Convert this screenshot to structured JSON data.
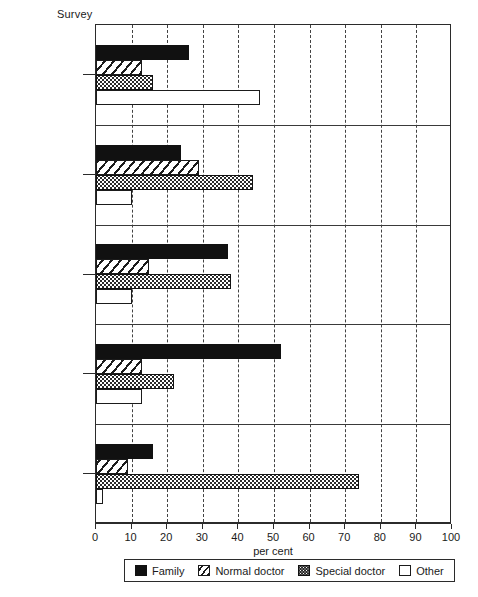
{
  "chart_data": {
    "type": "bar",
    "orientation": "horizontal",
    "title": "",
    "ylabel": "Survey",
    "xlabel": "per cent",
    "xlim": [
      0,
      100
    ],
    "xticks": [
      0,
      10,
      20,
      30,
      40,
      50,
      60,
      70,
      80,
      90,
      100
    ],
    "grid": true,
    "grid_axis": "x",
    "grid_style": "dashed",
    "legend_position": "below-axis",
    "categories": [
      "CAR",
      "Guinea Bissau",
      "Togo",
      "Burundi",
      "Mauritius"
    ],
    "series": [
      {
        "name": "Family",
        "pattern": "solid-black",
        "values": [
          26,
          24,
          37,
          52,
          16
        ]
      },
      {
        "name": "Normal doctor",
        "pattern": "diagonal-hatch",
        "values": [
          13,
          29,
          15,
          13,
          9
        ]
      },
      {
        "name": "Special doctor",
        "pattern": "dotted-dark",
        "values": [
          16,
          44,
          38,
          22,
          74
        ]
      },
      {
        "name": "Other",
        "pattern": "white-open",
        "values": [
          46,
          10,
          10,
          13,
          2
        ]
      }
    ]
  },
  "axis": {
    "y_title": "Survey",
    "x_title": "per cent",
    "tick_labels": [
      "0",
      "10",
      "20",
      "30",
      "40",
      "50",
      "60",
      "70",
      "80",
      "90",
      "100"
    ]
  },
  "categories": [
    {
      "label": "CAR"
    },
    {
      "label": "Guinea Bissau"
    },
    {
      "label": "Togo"
    },
    {
      "label": "Burundi"
    },
    {
      "label": "Mauritius"
    }
  ],
  "legend": {
    "items": [
      {
        "label": "Family",
        "swatch": "solid-black-swatch"
      },
      {
        "label": "Normal doctor",
        "swatch": "diagonal-hatch-swatch"
      },
      {
        "label": "Special doctor",
        "swatch": "dotted-dark-swatch"
      },
      {
        "label": "Other",
        "swatch": "white-open-swatch"
      }
    ]
  },
  "colors": {
    "ink": "#111111",
    "frame": "#2b2b2b",
    "background": "#ffffff"
  }
}
